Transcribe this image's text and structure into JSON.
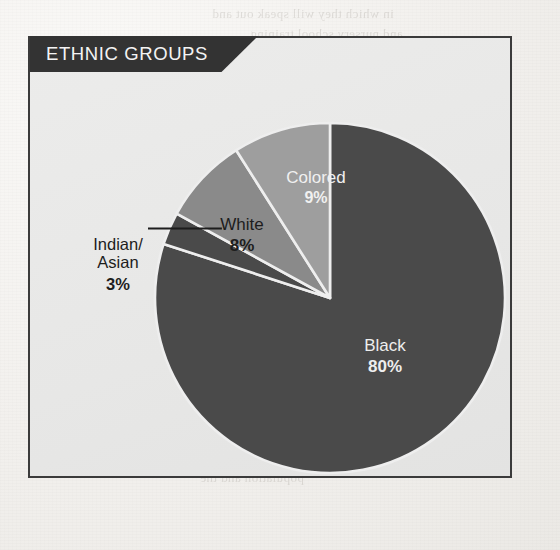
{
  "panel": {
    "title": "ETHNIC GROUPS"
  },
  "bleed_through": [
    {
      "text": "in which they will speak out and",
      "x": 212,
      "y": 6
    },
    {
      "text": "and nursery school training",
      "x": 250,
      "y": 26
    },
    {
      "text": "the laws on English and Afrikaans",
      "x": 228,
      "y": 52
    },
    {
      "text": "in the tongue",
      "x": 404,
      "y": 78
    },
    {
      "text": "seven",
      "x": 430,
      "y": 100
    },
    {
      "text": "the whole country in",
      "x": 150,
      "y": 430
    },
    {
      "text": "and to distinguish among the",
      "x": 150,
      "y": 452
    },
    {
      "text": "population and the",
      "x": 200,
      "y": 470
    }
  ],
  "chart_data": {
    "type": "pie",
    "title": "ETHNIC GROUPS",
    "unit": "%",
    "start_angle_deg": 0,
    "direction": "clockwise",
    "total": 100,
    "categories": [
      "Black",
      "Colored",
      "White",
      "Indian/Asian"
    ],
    "values": [
      80,
      9,
      8,
      3
    ],
    "slices": [
      {
        "label": "Black",
        "value": 80,
        "pct_text": "80%",
        "color": "#4a4a4a",
        "text_color": "#eeeeee",
        "label_placement": "inside",
        "start_deg": 0,
        "end_deg": 288
      },
      {
        "label": "Indian/\nAsian",
        "value": 3,
        "pct_text": "3%",
        "color": "#4a4a4a",
        "text_color": "#1d1d1d",
        "label_placement": "outside-leader",
        "start_deg": 288,
        "end_deg": 298.8
      },
      {
        "label": "White",
        "value": 8,
        "pct_text": "8%",
        "color": "#8a8a8a",
        "text_color": "#1d1d1d",
        "label_placement": "inside",
        "start_deg": 298.8,
        "end_deg": 327.6
      },
      {
        "label": "Colored",
        "value": 9,
        "pct_text": "9%",
        "color": "#9e9e9e",
        "text_color": "#f0f0f0",
        "label_placement": "inside",
        "start_deg": 327.6,
        "end_deg": 360
      }
    ],
    "geometry": {
      "cx": 330,
      "cy": 298,
      "r": 175,
      "gap_color": "#eeeeee"
    },
    "legend": "none",
    "grid": false
  },
  "labels": {
    "black": {
      "name": "Black",
      "pct": "80%"
    },
    "colored": {
      "name": "Colored",
      "pct": "9%"
    },
    "white": {
      "name": "White",
      "pct": "8%"
    },
    "indian": {
      "line1": "Indian/",
      "line2": "Asian",
      "pct": "3%"
    }
  },
  "colors": {
    "slice_dark": "#4a4a4a",
    "slice_mid": "#8a8a8a",
    "slice_light": "#9e9e9e",
    "panel_bg": "#e8e8e7",
    "panel_border": "#3b3b3b",
    "banner_bg": "#333333",
    "paper": "#f2f0ed"
  }
}
